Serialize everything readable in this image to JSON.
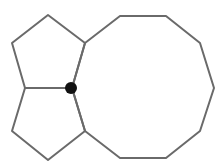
{
  "diagram": {
    "stroke_color": "#6a6a6a",
    "dot_color": "#111111",
    "shapes": [
      {
        "name": "top-pentagon",
        "points": "48,15 85,43 72,88 25,88 12,43"
      },
      {
        "name": "bottom-pentagon",
        "points": "25,88 72,88 85,131 48,160 12,131"
      },
      {
        "name": "decagon",
        "points": "85,43 120,16 166,16 200,43 214,88 200,131 166,158 120,158 85,131 72,88"
      }
    ],
    "marked_vertex": {
      "cx": 71,
      "cy": 88,
      "r": 6
    }
  }
}
